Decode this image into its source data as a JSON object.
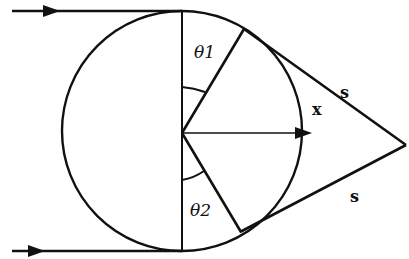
{
  "diagram": {
    "type": "geometry",
    "colors": {
      "stroke": "#111111",
      "background": "#ffffff"
    },
    "labels": {
      "theta1": "θ1",
      "theta2": "θ2",
      "x": "x",
      "s_upper": "s",
      "s_lower": "s"
    },
    "elements": [
      {
        "id": "circle",
        "kind": "circle",
        "center": [
          182,
          132
        ],
        "radius": 120
      },
      {
        "id": "top-ray",
        "kind": "arrow-line",
        "from": [
          12,
          11
        ],
        "to": [
          182,
          11
        ]
      },
      {
        "id": "bottom-ray",
        "kind": "arrow-line",
        "from": [
          12,
          251
        ],
        "to": [
          182,
          251
        ]
      },
      {
        "id": "vertical-diameter",
        "kind": "line",
        "from": [
          182,
          11
        ],
        "to": [
          182,
          251
        ]
      },
      {
        "id": "radius-theta1",
        "kind": "line",
        "from": [
          182,
          132
        ],
        "to": [
          244,
          29
        ]
      },
      {
        "id": "radius-theta2",
        "kind": "line",
        "from": [
          182,
          132
        ],
        "to": [
          240,
          232
        ]
      },
      {
        "id": "tangent-upper",
        "kind": "line",
        "from": [
          244,
          29
        ],
        "to": [
          405,
          145
        ]
      },
      {
        "id": "tangent-lower",
        "kind": "line",
        "from": [
          240,
          232
        ],
        "to": [
          405,
          145
        ]
      },
      {
        "id": "x-vector",
        "kind": "arrow-line",
        "from": [
          182,
          132
        ],
        "to": [
          310,
          132
        ]
      }
    ]
  }
}
